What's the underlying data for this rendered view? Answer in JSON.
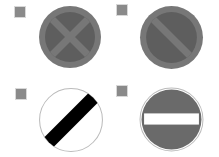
{
  "grid": {
    "columns": 2,
    "rows": 2
  },
  "colors": {
    "background": "#ffffff",
    "checkbox": "#8a8a8a",
    "sign_outer": "#777777",
    "sign_inner": "#5e5e5e",
    "sign_black": "#000000",
    "sign_white": "#ffffff",
    "sign_outline": "#bbbbbb"
  },
  "signs": [
    {
      "name": "clearway",
      "icon": "clearway-sign-icon",
      "label": "Clearway (no stopping)",
      "checked": false
    },
    {
      "name": "no-waiting",
      "icon": "no-waiting-sign-icon",
      "label": "No waiting",
      "checked": false
    },
    {
      "name": "national-speed-limit",
      "icon": "national-speed-limit-sign-icon",
      "label": "National speed limit applies",
      "checked": false
    },
    {
      "name": "no-entry",
      "icon": "no-entry-sign-icon",
      "label": "No entry",
      "checked": false
    }
  ]
}
